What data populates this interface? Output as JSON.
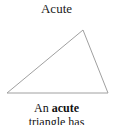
{
  "figure": {
    "title": "Acute",
    "background_color": "#ffffff",
    "width": 113,
    "height": 125
  },
  "shape": {
    "name": "acute-triangle",
    "stroke_color": "#a0a0a0",
    "fill_color": "none",
    "stroke_width": 1,
    "vertices": [
      {
        "label": "apex",
        "x": 83,
        "y": 10
      },
      {
        "label": "bottom-right",
        "x": 108,
        "y": 73
      },
      {
        "label": "bottom-left",
        "x": 7,
        "y": 73
      }
    ],
    "points_attr": "83,10 108,73 7,73"
  },
  "caption": {
    "line1_prefix": "An ",
    "line1_emphasis": "acute",
    "line2": "triangle has"
  }
}
